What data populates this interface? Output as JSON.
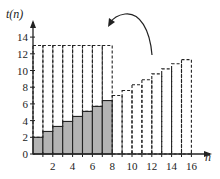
{
  "chart_data": {
    "type": "bar",
    "title": "",
    "xlabel": "n",
    "ylabel": "t(n)",
    "xlim": [
      0,
      16.8
    ],
    "ylim": [
      0,
      15
    ],
    "x_ticks": [
      2,
      4,
      6,
      8,
      10,
      12,
      14,
      16
    ],
    "y_ticks": [
      0,
      2,
      4,
      6,
      8,
      10,
      12,
      14
    ],
    "grid": false,
    "series": [
      {
        "name": "shaded bars (n=1..8)",
        "style": "solid-gray",
        "x": [
          1,
          2,
          3,
          4,
          5,
          6,
          7,
          8
        ],
        "values": [
          2.0,
          2.7,
          3.3,
          3.9,
          4.5,
          5.1,
          5.7,
          6.4
        ]
      },
      {
        "name": "dashed bars (n=9..16)",
        "style": "dashed",
        "x": [
          9,
          10,
          11,
          12,
          13,
          14,
          15,
          16
        ],
        "values": [
          7.0,
          7.6,
          8.3,
          8.9,
          9.6,
          10.2,
          10.8,
          11.3
        ]
      },
      {
        "name": "flipped dashed bars over n=1..8",
        "style": "dashed-outline",
        "x": [
          1,
          2,
          3,
          4,
          5,
          6,
          7,
          8
        ],
        "values": [
          13,
          13,
          13,
          13,
          13,
          13,
          13,
          13
        ]
      }
    ],
    "annotations": [
      {
        "type": "curved-arrow",
        "from": "right dashed bars",
        "to": "top-left dashed rectangle",
        "meaning": "rotate/flip bars"
      }
    ]
  },
  "labels": {
    "ylabel": "t(n)",
    "xlabel": "n",
    "x_ticks": [
      "2",
      "4",
      "6",
      "8",
      "10",
      "12",
      "14",
      "16"
    ],
    "y_ticks": [
      "0",
      "2",
      "4",
      "6",
      "8",
      "10",
      "12",
      "14"
    ]
  },
  "colors": {
    "bar_fill": "#b3b3b3",
    "stroke": "#222222"
  }
}
